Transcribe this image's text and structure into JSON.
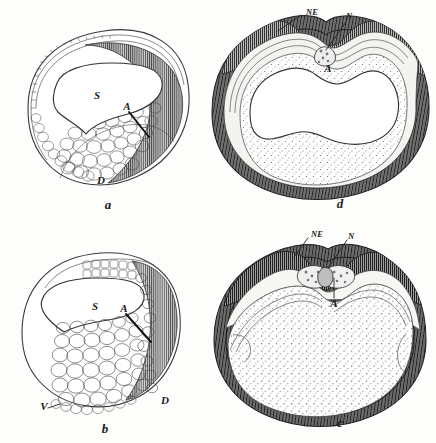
{
  "figure": {
    "background_color": "#fdfdfb",
    "ink_color": "#2b2b2b",
    "panel_count": 4
  },
  "panels": [
    {
      "id": "a",
      "caption": "a",
      "position": "top-left",
      "style": "cell-outline-line-drawing",
      "labels": [
        {
          "text": "S",
          "x": 97,
          "y": 95,
          "leader": false
        },
        {
          "text": "A",
          "x": 127,
          "y": 108,
          "leader": true
        },
        {
          "text": "D",
          "x": 101,
          "y": 181,
          "leader": false
        }
      ]
    },
    {
      "id": "b",
      "caption": "b",
      "position": "bottom-left",
      "style": "cell-outline-line-drawing",
      "labels": [
        {
          "text": "S",
          "x": 95,
          "y": 307,
          "leader": false
        },
        {
          "text": "A",
          "x": 124,
          "y": 312,
          "leader": true
        },
        {
          "text": "V",
          "x": 52,
          "y": 404,
          "leader": true
        },
        {
          "text": "D",
          "x": 165,
          "y": 402,
          "leader": false
        }
      ]
    },
    {
      "id": "c",
      "caption": "c",
      "position": "bottom-right",
      "style": "stippled-shaded-section",
      "labels": [
        {
          "text": "NE",
          "x": 306,
          "y": 234,
          "leader": true
        },
        {
          "text": "N",
          "x": 348,
          "y": 236,
          "leader": true
        },
        {
          "text": "A",
          "x": 334,
          "y": 283,
          "leader": true
        }
      ]
    },
    {
      "id": "d",
      "caption": "d",
      "position": "top-right",
      "style": "stippled-shaded-section",
      "labels": [
        {
          "text": "NE",
          "x": 301,
          "y": 13,
          "leader": true
        },
        {
          "text": "N",
          "x": 345,
          "y": 17,
          "leader": true
        },
        {
          "text": "A",
          "x": 327,
          "y": 68,
          "leader": false
        }
      ]
    }
  ],
  "label_glossary": {
    "S": "S",
    "A": "A",
    "D": "D",
    "V": "V",
    "NE": "NE",
    "N": "N"
  }
}
